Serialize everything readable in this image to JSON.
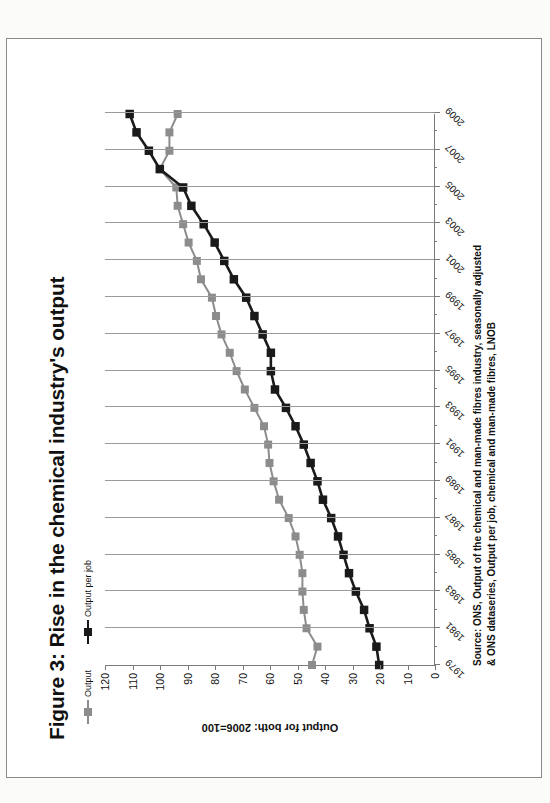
{
  "figure": {
    "title": "Figure 3: Rise in the chemical industry's output",
    "source_line_1": "Source: ONS, Output of the chemical and man-made fibres industry, seasonally adjusted",
    "source_line_2": "& ONS dataseries, Output per job, chemical and man-made fibres, LNOB"
  },
  "legend": {
    "items": [
      {
        "label": "Output",
        "color": "#8c8c8c",
        "marker": "square-marker-icon"
      },
      {
        "label": "Output per job",
        "color": "#1a1a1a",
        "marker": "square-marker-icon"
      }
    ],
    "position": "top-left"
  },
  "chart_data": {
    "type": "line",
    "title": "Figure 3: Rise in the chemical industry's output",
    "xlabel": "",
    "ylabel": "Output for both: 2006=100",
    "ylim": [
      0,
      120
    ],
    "ytick_step": 10,
    "yticks": [
      0,
      10,
      20,
      30,
      40,
      50,
      60,
      70,
      80,
      90,
      100,
      110,
      120
    ],
    "grid": "vertical",
    "x": [
      1979,
      1980,
      1981,
      1982,
      1983,
      1984,
      1985,
      1986,
      1987,
      1988,
      1989,
      1990,
      1991,
      1992,
      1993,
      1994,
      1995,
      1996,
      1997,
      1998,
      1999,
      2000,
      2001,
      2002,
      2003,
      2004,
      2005,
      2006,
      2007,
      2008,
      2009
    ],
    "xtick_labels": [
      "1979",
      "1981",
      "1983",
      "1985",
      "1987",
      "1989",
      "1991",
      "1993",
      "1995",
      "1997",
      "1999",
      "2001",
      "2003",
      "2005",
      "2007",
      "2009"
    ],
    "series": [
      {
        "name": "Output",
        "color": "#8c8c8c",
        "values": [
          44.5,
          42.5,
          46.5,
          47.5,
          48.0,
          48.0,
          49.0,
          50.5,
          53.0,
          56.5,
          58.5,
          60.0,
          60.5,
          62.0,
          65.5,
          69.0,
          72.0,
          74.5,
          77.5,
          79.5,
          81.0,
          85.0,
          86.5,
          89.5,
          91.5,
          93.5,
          94.0,
          100.0,
          96.5,
          96.5,
          93.5
        ]
      },
      {
        "name": "Output per job",
        "color": "#1a1a1a",
        "values": [
          20.0,
          21.0,
          23.5,
          25.5,
          28.5,
          31.0,
          33.0,
          35.0,
          37.5,
          40.5,
          42.5,
          45.0,
          47.5,
          50.5,
          54.0,
          58.0,
          59.5,
          59.5,
          62.5,
          65.5,
          68.5,
          73.0,
          76.5,
          80.0,
          84.0,
          88.5,
          91.5,
          100.0,
          104.0,
          108.5,
          111.0
        ]
      }
    ]
  }
}
